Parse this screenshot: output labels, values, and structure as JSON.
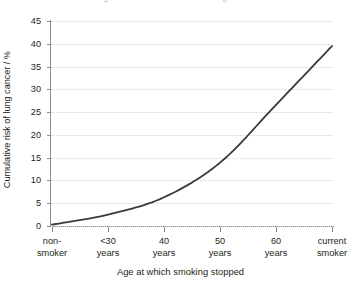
{
  "figure": {
    "clipped_title_fragment": "Figure: cumulative risk of lung cancer"
  },
  "chart_data": {
    "type": "line",
    "title": "",
    "categories": [
      "non-smoker",
      "<30 years",
      "40 years",
      "50 years",
      "60 years",
      "current smoker"
    ],
    "category_lines": [
      [
        "non-",
        "smoker"
      ],
      [
        "<30",
        "years"
      ],
      [
        "40",
        "years"
      ],
      [
        "50",
        "years"
      ],
      [
        "60",
        "years"
      ],
      [
        "current",
        "smoker"
      ]
    ],
    "values": [
      0.3,
      2.5,
      6.3,
      13.9,
      26.6,
      39.5
    ],
    "series": [
      {
        "name": "Cumulative risk of lung cancer",
        "values": [
          0.3,
          2.5,
          6.3,
          13.9,
          26.6,
          39.5
        ]
      }
    ],
    "xlabel": "Age at which smoking stopped",
    "ylabel": "Cumulative risk of lung cancer / %",
    "ylim": [
      0,
      45
    ],
    "ytick_step": 5,
    "yticks": [
      0,
      5,
      10,
      15,
      20,
      25,
      30,
      35,
      40,
      45
    ],
    "ytick_labels": [
      "0",
      "5",
      "10",
      "15",
      "20",
      "25",
      "30",
      "35",
      "40",
      "45"
    ],
    "grid": "horizontal-dotted",
    "legend": "none",
    "line_color": "#3a3a3c",
    "grid_color": "#d6d6d8",
    "axis_color": "#8a8a8d",
    "text_color": "#231f20",
    "background_color": "#ffffff"
  }
}
